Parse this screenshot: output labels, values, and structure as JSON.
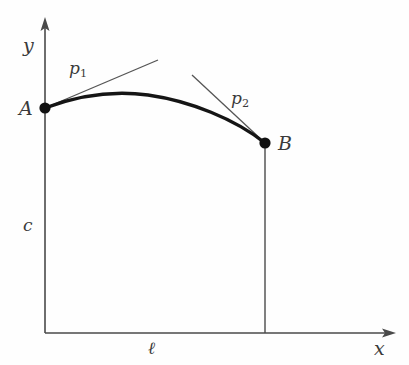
{
  "figure": {
    "kind": "math-diagram",
    "caption_text": "",
    "background_color": "#fefefe",
    "ink_color": "#3a3a3a",
    "curve_color": "#1a1a1a",
    "axes": {
      "y_axis_label": "y",
      "x_axis_label": "x",
      "origin_px": [
        45,
        333
      ],
      "y_axis_top_px": [
        45,
        18
      ],
      "x_axis_right_px": [
        396,
        333
      ]
    },
    "points": [
      {
        "name": "A",
        "label": "A",
        "px": [
          45,
          108
        ]
      },
      {
        "name": "B",
        "label": "B",
        "px": [
          265,
          143
        ]
      }
    ],
    "tangents": [
      {
        "name": "p1",
        "label_main": "p",
        "label_sub": "1",
        "from_px": [
          45,
          108
        ],
        "to_px": [
          158,
          60
        ]
      },
      {
        "name": "p2",
        "label_main": "p",
        "label_sub": "2",
        "from_px": [
          192,
          75
        ],
        "to_px": [
          265,
          143
        ]
      }
    ],
    "dimensions": [
      {
        "name": "c",
        "label": "c",
        "meaning": "vertical-height-label"
      },
      {
        "name": "l",
        "label": "ℓ",
        "meaning": "horizontal-span-label"
      }
    ],
    "curve": {
      "name": "sag-curve",
      "start_px": [
        45,
        108
      ],
      "apex_px": [
        148,
        95
      ],
      "end_px": [
        265,
        143
      ]
    },
    "dropline": {
      "name": "b-dropline",
      "from_px": [
        265,
        143
      ],
      "to_px": [
        265,
        333
      ]
    }
  },
  "labels": {
    "y": "y",
    "x": "x",
    "A": "A",
    "B": "B",
    "p1_main": "p",
    "p1_sub": "1",
    "p2_main": "p",
    "p2_sub": "2",
    "c": "c",
    "l": "ℓ"
  }
}
